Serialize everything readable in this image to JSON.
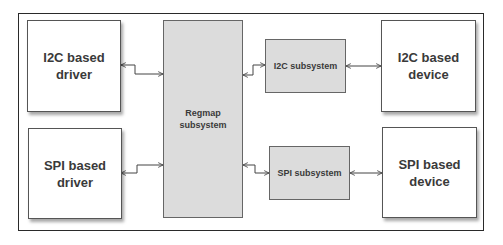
{
  "diagram": {
    "nodes": {
      "i2c_driver": {
        "line1": "I2C based",
        "line2": "driver"
      },
      "spi_driver": {
        "line1": "SPI based",
        "line2": "driver"
      },
      "regmap": {
        "line1": "Regmap",
        "line2": "subsystem"
      },
      "i2c_subsystem": {
        "label": "I2C subsystem"
      },
      "spi_subsystem": {
        "label": "SPI subsystem"
      },
      "i2c_device": {
        "line1": "I2C based",
        "line2": "device"
      },
      "spi_device": {
        "line1": "SPI based",
        "line2": "device"
      }
    },
    "edges": [
      {
        "from": "i2c_driver",
        "to": "regmap",
        "type": "bidirectional"
      },
      {
        "from": "spi_driver",
        "to": "regmap",
        "type": "bidirectional"
      },
      {
        "from": "regmap",
        "to": "i2c_subsystem",
        "type": "bidirectional"
      },
      {
        "from": "regmap",
        "to": "spi_subsystem",
        "type": "bidirectional"
      },
      {
        "from": "i2c_subsystem",
        "to": "i2c_device",
        "type": "bidirectional"
      },
      {
        "from": "spi_subsystem",
        "to": "spi_device",
        "type": "bidirectional"
      }
    ],
    "colors": {
      "frame": "#2a2a2a",
      "white_box": "#ffffff",
      "grey_box": "#dcdcdc",
      "text": "#3a3a3a",
      "wire": "#444444"
    }
  }
}
